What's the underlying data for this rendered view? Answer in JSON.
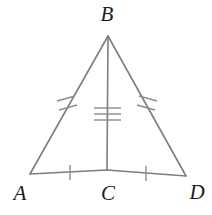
{
  "figure": {
    "type": "geometry-diagram",
    "background_color": "#ffffff",
    "stroke_color": "#7d7d7d",
    "tick_color": "#8c8c8c",
    "label_color": "#1c1c1c",
    "stroke_width": 1.6,
    "tick_width": 1.4
  },
  "points": [
    {
      "id": "B",
      "label": "B",
      "x": 108,
      "y": 36,
      "label_x": 107,
      "label_y": 14
    },
    {
      "id": "A",
      "label": "A",
      "x": 30,
      "y": 174,
      "label_x": 20,
      "label_y": 193
    },
    {
      "id": "C",
      "label": "C",
      "x": 107,
      "y": 170,
      "label_x": 108,
      "label_y": 193
    },
    {
      "id": "D",
      "label": "D",
      "x": 186,
      "y": 176,
      "label_x": 197,
      "label_y": 192
    }
  ],
  "segments": [
    {
      "id": "AB",
      "from": "A",
      "to": "B",
      "x1": 30,
      "y1": 174,
      "x2": 108,
      "y2": 36,
      "tick_count": 2,
      "tick_style": "slash"
    },
    {
      "id": "BD",
      "from": "B",
      "to": "D",
      "x1": 108,
      "y1": 36,
      "x2": 186,
      "y2": 176,
      "tick_count": 2,
      "tick_style": "slash"
    },
    {
      "id": "BC",
      "from": "B",
      "to": "C",
      "x1": 108,
      "y1": 36,
      "x2": 107,
      "y2": 170,
      "tick_count": 3,
      "tick_style": "cross"
    },
    {
      "id": "AC",
      "from": "A",
      "to": "C",
      "x1": 30,
      "y1": 174,
      "x2": 107,
      "y2": 170,
      "tick_count": 1,
      "tick_style": "cross"
    },
    {
      "id": "CD",
      "from": "C",
      "to": "D",
      "x1": 107,
      "y1": 170,
      "x2": 186,
      "y2": 176,
      "tick_count": 1,
      "tick_style": "cross"
    }
  ],
  "tick_marks": [
    {
      "id": "tick-ab-1",
      "segment": "AB",
      "x1": 57,
      "y1": 101,
      "x2": 75,
      "y2": 96
    },
    {
      "id": "tick-ab-2",
      "segment": "AB",
      "x1": 59,
      "y1": 110,
      "x2": 77,
      "y2": 105
    },
    {
      "id": "tick-bd-1",
      "segment": "BD",
      "x1": 139,
      "y1": 96,
      "x2": 157,
      "y2": 101
    },
    {
      "id": "tick-bd-2",
      "segment": "BD",
      "x1": 137,
      "y1": 105,
      "x2": 155,
      "y2": 110
    },
    {
      "id": "tick-bc-1",
      "segment": "BC",
      "x1": 94,
      "y1": 108,
      "x2": 121,
      "y2": 108
    },
    {
      "id": "tick-bc-2",
      "segment": "BC",
      "x1": 94,
      "y1": 114,
      "x2": 121,
      "y2": 114
    },
    {
      "id": "tick-bc-3",
      "segment": "BC",
      "x1": 94,
      "y1": 120,
      "x2": 121,
      "y2": 120
    },
    {
      "id": "tick-ac-1",
      "segment": "AC",
      "x1": 70,
      "y1": 165,
      "x2": 70,
      "y2": 180
    },
    {
      "id": "tick-cd-1",
      "segment": "CD",
      "x1": 146,
      "y1": 166,
      "x2": 146,
      "y2": 181
    }
  ]
}
